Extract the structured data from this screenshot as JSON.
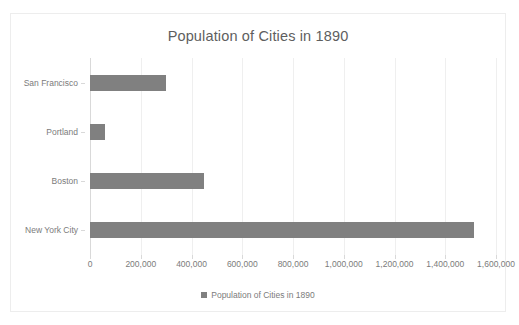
{
  "chart_data": {
    "type": "bar",
    "orientation": "horizontal",
    "title": "Population of Cities in 1890",
    "xlabel": "",
    "ylabel": "",
    "categories": [
      "San Francisco",
      "Portland",
      "Boston",
      "New York City"
    ],
    "values": [
      300000,
      58000,
      450000,
      1515000
    ],
    "series": [
      {
        "name": "Population of Cities in 1890",
        "values": [
          300000,
          58000,
          450000,
          1515000
        ]
      }
    ],
    "xlim": [
      0,
      1600000
    ],
    "xticks": [
      0,
      200000,
      400000,
      600000,
      800000,
      1000000,
      1200000,
      1400000,
      1600000
    ],
    "xtick_labels": [
      "0",
      "200,000",
      "400,000",
      "600,000",
      "800,000",
      "1,000,000",
      "1,200,000",
      "1,400,000",
      "1,600,000"
    ],
    "grid": true,
    "grid_axis": "x",
    "legend": [
      "Population of Cities in 1890"
    ],
    "legend_position": "bottom",
    "bar_color": "#808080",
    "text_color": "#7b7b7b",
    "title_color": "#5e5e5e",
    "gridline_color": "#efefef",
    "frame_color": "#ededed",
    "background": "#ffffff"
  }
}
